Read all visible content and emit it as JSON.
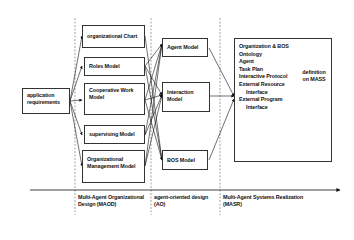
{
  "input": {
    "label": "application requirements"
  },
  "maod": {
    "boxes": [
      {
        "label": "organizational Chart"
      },
      {
        "label": "Roles Model"
      },
      {
        "label": "Cooperative Work Model"
      },
      {
        "label": "supervising Model"
      },
      {
        "label": "Organizational Management Model"
      }
    ],
    "phase_label": "Multi-Agent Organizational Design (MAOD)"
  },
  "ao": {
    "boxes": [
      {
        "label": "Agent Model"
      },
      {
        "label": "Interaction Model"
      },
      {
        "label": "BOS Model"
      }
    ],
    "phase_label": "agent-oriented design (AO)"
  },
  "masr": {
    "items": [
      "Organization & BOS",
      "Ontology",
      "Agent",
      "Task Plan",
      "Interactive Protocol",
      "External Resource",
      "Interface",
      "External Program",
      "Interface"
    ],
    "indented": [
      false,
      false,
      false,
      false,
      false,
      false,
      true,
      false,
      true
    ],
    "brace_note": "definition on MASS",
    "phase_label": "Multi-Agent Systems Realization (MASR)"
  }
}
